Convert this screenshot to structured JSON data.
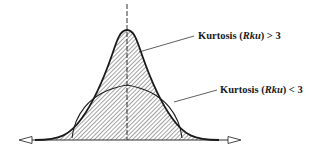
{
  "diagram": {
    "labels": {
      "high": {
        "prefix": "Kurtosis (",
        "symbol": "Rku",
        "suffix": ") > 3"
      },
      "low": {
        "prefix": "Kurtosis (",
        "symbol": "Rku",
        "suffix": ") < 3"
      }
    },
    "curves": [
      {
        "name": "leptokurtic",
        "description": "Peaked distribution, Rku > 3",
        "hatched": true
      },
      {
        "name": "platykurtic",
        "description": "Flat distribution, Rku < 3",
        "hatched": false
      }
    ],
    "colors": {
      "stroke": "#1a1a1a",
      "hatch": "#333333",
      "background": "#ffffff"
    }
  }
}
